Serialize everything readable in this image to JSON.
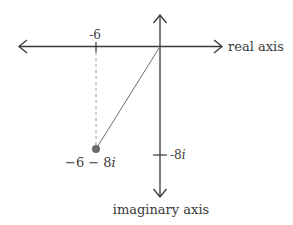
{
  "diagram": {
    "type": "complex-plane",
    "real_axis_label": "real axis",
    "imaginary_axis_label": "imaginary axis",
    "real_tick_label": "-6",
    "imag_tick_label_num": "-8",
    "imag_tick_label_i": "i",
    "point_label_main": "−6 − 8",
    "point_label_i": "i",
    "point": {
      "re": -6,
      "im": -8
    },
    "colors": {
      "axis": "#3a3a3a",
      "segment": "#6e6e6e",
      "dashed": "#9a9a9a",
      "point": "#6a6a6a"
    }
  }
}
